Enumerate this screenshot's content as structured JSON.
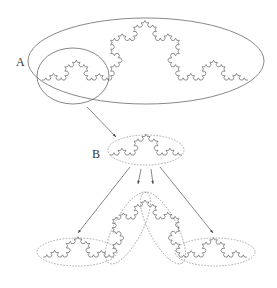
{
  "labels": {
    "A": "A",
    "B": "B"
  },
  "colors": {
    "curve": "#3a3a3a",
    "ellipse": "#6a6a6a",
    "dashed": "#8a8a8a",
    "arrow": "#555555",
    "background": "#ffffff"
  },
  "koch_curves": [
    {
      "name": "top-koch-curve",
      "start": [
        42,
        80
      ],
      "end": [
        248,
        80
      ],
      "depth": 4,
      "up": true
    },
    {
      "name": "b-koch-curve",
      "start": [
        110,
        155
      ],
      "end": [
        182,
        155
      ],
      "depth": 3,
      "up": true
    },
    {
      "name": "bottom-left-koch-curve",
      "start": [
        43,
        257
      ],
      "end": [
        113,
        257
      ],
      "depth": 3,
      "up": true
    },
    {
      "name": "bottom-center-left-koch-curve",
      "start": [
        113,
        257
      ],
      "end": [
        145,
        200
      ],
      "depth": 3,
      "up": true
    },
    {
      "name": "bottom-center-right-koch-curve",
      "start": [
        145,
        200
      ],
      "end": [
        180,
        257
      ],
      "depth": 3,
      "up": true
    },
    {
      "name": "bottom-right-koch-curve",
      "start": [
        180,
        257
      ],
      "end": [
        247,
        257
      ],
      "depth": 3,
      "up": true
    }
  ],
  "ellipses": [
    {
      "name": "ellipse-a",
      "cx": 146,
      "cy": 61,
      "rx": 118,
      "ry": 43,
      "rot": 0,
      "dashed": false
    },
    {
      "name": "small-circle",
      "cx": 73,
      "cy": 76,
      "rx": 36,
      "ry": 28,
      "rot": 0,
      "dashed": false
    },
    {
      "name": "ellipse-b",
      "cx": 146,
      "cy": 150,
      "rx": 38,
      "ry": 15,
      "rot": 0,
      "dashed": true
    },
    {
      "name": "bottom-left-ellipse",
      "cx": 77,
      "cy": 252,
      "rx": 40,
      "ry": 14,
      "rot": 0,
      "dashed": true
    },
    {
      "name": "bottom-center-left-ellipse",
      "cx": 128,
      "cy": 228,
      "rx": 40,
      "ry": 14,
      "rot": -62,
      "dashed": true
    },
    {
      "name": "bottom-center-right-ellipse",
      "cx": 163,
      "cy": 228,
      "rx": 40,
      "ry": 14,
      "rot": 62,
      "dashed": true
    },
    {
      "name": "bottom-right-ellipse",
      "cx": 215,
      "cy": 252,
      "rx": 40,
      "ry": 14,
      "rot": 0,
      "dashed": true
    }
  ],
  "arrows": [
    {
      "name": "arrow-a-to-b",
      "from": [
        87,
        107
      ],
      "to": [
        116,
        137
      ]
    },
    {
      "name": "arrow-b-to-bottom-left",
      "from": [
        130,
        167
      ],
      "to": [
        78,
        233
      ]
    },
    {
      "name": "arrow-b-to-center-left",
      "from": [
        141,
        169
      ],
      "to": [
        138,
        184
      ]
    },
    {
      "name": "arrow-b-to-center-right",
      "from": [
        151,
        169
      ],
      "to": [
        153,
        184
      ]
    },
    {
      "name": "arrow-b-to-bottom-right",
      "from": [
        160,
        167
      ],
      "to": [
        213,
        233
      ]
    }
  ],
  "label_positions": {
    "A": [
      16,
      66
    ],
    "B": [
      92,
      158
    ]
  }
}
